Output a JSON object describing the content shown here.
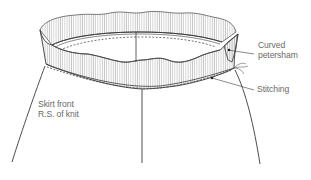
{
  "diagram": {
    "labels": {
      "curved_petersham": [
        "Curved",
        "petersham"
      ],
      "stitching": "Stitching",
      "skirt_front": [
        "Skirt front",
        "R.S. of knit"
      ]
    },
    "colors": {
      "line": "#3a3a3a",
      "hatch": "#8a8a8a",
      "text": "#6a6a6a",
      "background": "#ffffff"
    }
  }
}
